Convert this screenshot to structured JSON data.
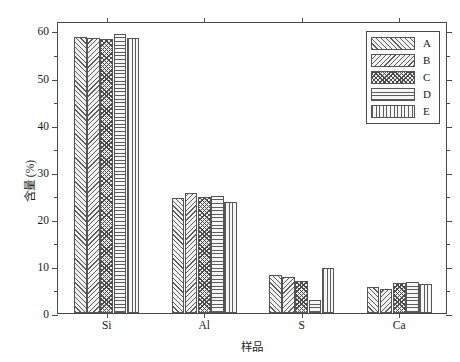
{
  "chart_data": {
    "type": "bar",
    "title": "",
    "subtitle": "",
    "xlabel": "样品",
    "ylabel": "含量 (%)",
    "categories": [
      "Si",
      "Al",
      "S",
      "Ca"
    ],
    "series": [
      {
        "name": "A",
        "values": [
          58.6,
          24.4,
          8.0,
          5.6
        ],
        "hatch": "forward-diagonal"
      },
      {
        "name": "B",
        "values": [
          58.4,
          25.4,
          7.7,
          5.2
        ],
        "hatch": "backward-diagonal"
      },
      {
        "name": "C",
        "values": [
          58.1,
          24.6,
          6.8,
          6.3
        ],
        "hatch": "crosshatch"
      },
      {
        "name": "D",
        "values": [
          59.2,
          24.9,
          2.7,
          6.6
        ],
        "hatch": "horizontal-lines"
      },
      {
        "name": "E",
        "values": [
          58.3,
          23.5,
          9.5,
          6.1
        ],
        "hatch": "vertical-lines"
      }
    ],
    "ylim": [
      0,
      62
    ],
    "ymajor_ticks": [
      0,
      10,
      20,
      30,
      40,
      50,
      60
    ],
    "ymajor_tick_labels": [
      "0",
      "10",
      "20",
      "30",
      "40",
      "50",
      "60"
    ],
    "yminor_ticks": [
      5,
      15,
      25,
      35,
      45,
      55
    ],
    "grid": false,
    "legend_position": "top-right",
    "legend_entries": [
      "A",
      "B",
      "C",
      "D",
      "E"
    ],
    "frame": true,
    "axis_color": "#4a4a4a"
  }
}
